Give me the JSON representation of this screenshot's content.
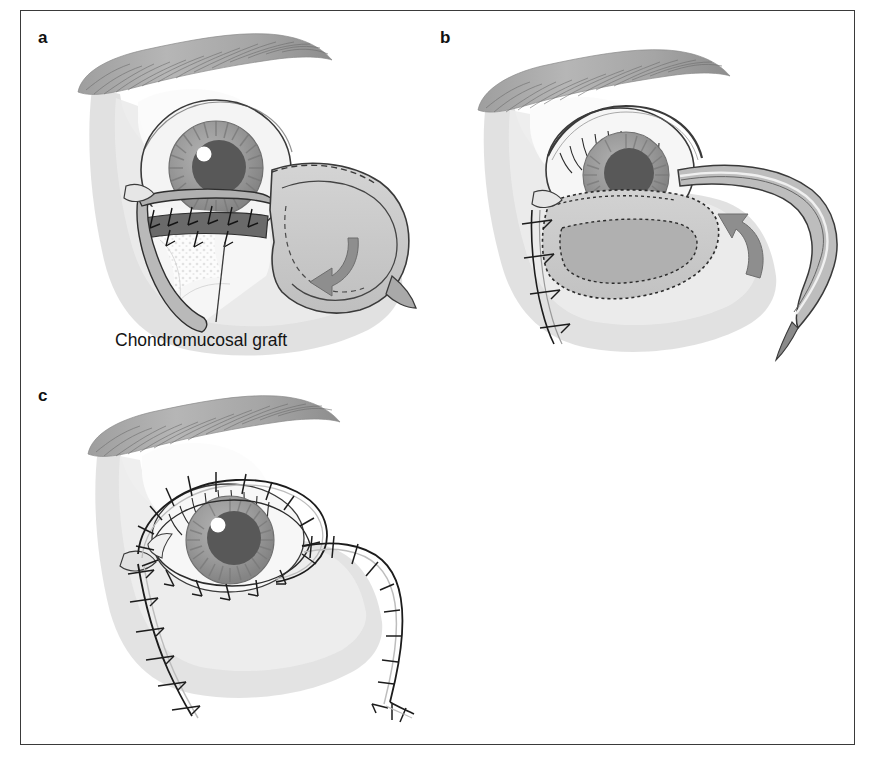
{
  "figure": {
    "border_color": "#3a3a3a",
    "background_color": "#ffffff"
  },
  "panels": [
    {
      "id": "a",
      "letter": "a",
      "description": "Lower eyelid defect with chondromucosal graft sutured in place and rotation flap outlined laterally",
      "annotations": [
        {
          "name": "chondromucosal-graft-label",
          "text": "Chondromucosal graft",
          "x": 95,
          "y": 320,
          "leader_from": [
            205,
            232
          ],
          "leader_to": [
            196,
            312
          ]
        }
      ]
    },
    {
      "id": "b",
      "letter": "b",
      "description": "Rotation flap being advanced medially toward the crescentic graft bed; interrupted sutures along the medial incision",
      "annotations": []
    },
    {
      "id": "c",
      "letter": "c",
      "description": "Completed reconstruction showing the sutured incision lines around the orbit and along the lateral and medial limbs",
      "annotations": []
    }
  ],
  "colors": {
    "skin_shadow": "#d9d9d9",
    "skin_shadow_light": "#e8e8e8",
    "brow_gray": "#a8a8a8",
    "brow_dark": "#6f6f6f",
    "iris_gray": "#9a9a9a",
    "iris_ring": "#7d7d7d",
    "pupil": "#5a5a5a",
    "highlight": "#ffffff",
    "sclera": "#f2f2f2",
    "graft_dark": "#6a6a6a",
    "cartilage": "#fbfbfb",
    "flap_fill": "#cfcfcf",
    "flap_fill_dark": "#b4b4b4",
    "outline": "#2b2b2b",
    "arrow": "#8e8e8e",
    "suture": "#1c1c1c"
  },
  "icons": {
    "rotation_arrow": "curved-rotation-arrow",
    "suture": "suture-stitch"
  }
}
